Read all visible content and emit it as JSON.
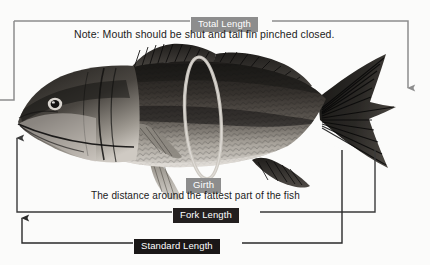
{
  "diagram": {
    "note": "Note:  Mouth should be shut and tail fin pinched closed.",
    "girth_description": "The distance around the fattest part of the fish",
    "measurements": [
      {
        "id": "total-length",
        "label": "Total Length",
        "chip_bg": "#8d8d8d",
        "line_color": "#8d8d8d"
      },
      {
        "id": "girth",
        "label": "Girth",
        "chip_bg": "#8d8d8d",
        "line_color": "#b4b4b4"
      },
      {
        "id": "fork-length",
        "label": "Fork Length",
        "chip_bg": "#231f1f",
        "line_color": "#3a3a3a"
      },
      {
        "id": "standard-length",
        "label": "Standard Length",
        "chip_bg": "#1a1717",
        "line_color": "#2a2a2a"
      }
    ],
    "colors": {
      "background": "#fbfbfa",
      "text": "#1c1c1c",
      "chip_text": "#ffffff",
      "fish_dark": "#2a2724",
      "fish_mid": "#6c6761",
      "fish_light": "#cfcac2",
      "girth_loop": "#c6c2bb"
    }
  }
}
